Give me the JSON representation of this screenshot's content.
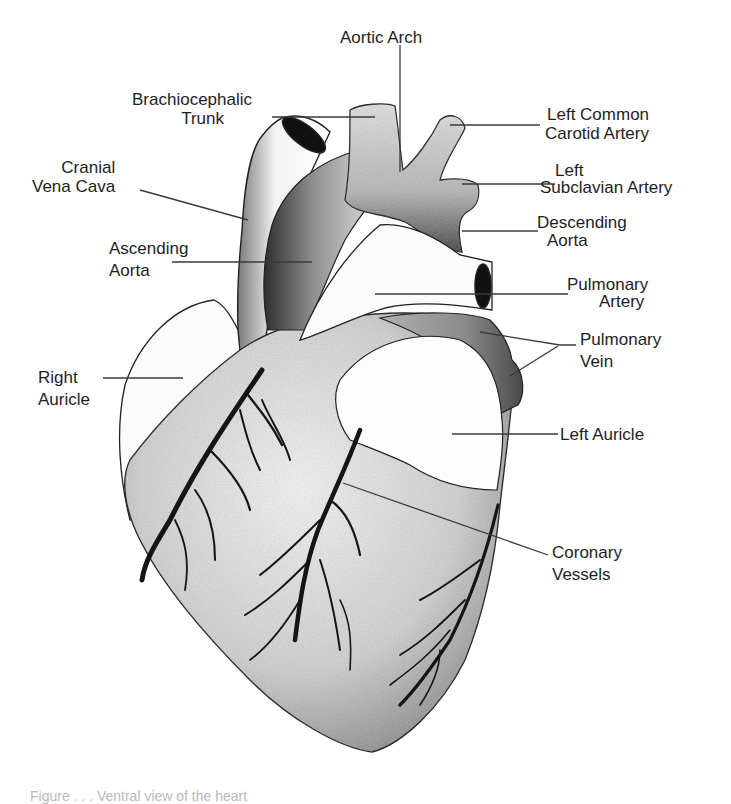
{
  "diagram": {
    "labels": {
      "aortic_arch": [
        "Aortic Arch"
      ],
      "brachiocephalic_trunk": [
        "Brachiocephalic",
        "Trunk"
      ],
      "left_common_carotid_artery": [
        "Left Common",
        "Carotid Artery"
      ],
      "cranial_vena_cava": [
        "Cranial",
        "Vena Cava"
      ],
      "left_subclavian_artery": [
        "Left",
        "Subclavian Artery"
      ],
      "descending_aorta": [
        "Descending",
        "Aorta"
      ],
      "ascending_aorta": [
        "Ascending",
        "Aorta"
      ],
      "pulmonary_artery": [
        "Pulmonary",
        "Artery"
      ],
      "pulmonary_vein": [
        "Pulmonary",
        "Vein"
      ],
      "right_auricle": [
        "Right",
        "Auricle"
      ],
      "left_auricle": [
        "Left Auricle"
      ],
      "coronary_vessels": [
        "Coronary",
        "Vessels"
      ]
    },
    "caption": "Figure . . .  Ventral view of the heart",
    "colors": {
      "background": "#ffffff",
      "ink": "#1e1e1e",
      "leader_line": "#3a3a3a",
      "shading_dark": "#2a2a2a",
      "shading_light": "#d8d8d8"
    }
  }
}
